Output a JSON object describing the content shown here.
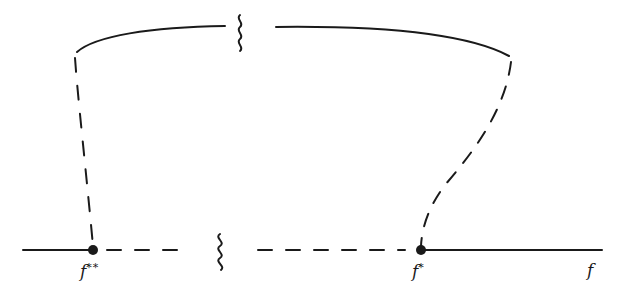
{
  "diagram": {
    "labels": {
      "f_double_star": {
        "base": "f",
        "sup": "**"
      },
      "f_star": {
        "base": "f",
        "sup": "*"
      },
      "f": {
        "base": "f"
      }
    },
    "points": [
      {
        "name": "f**",
        "x": 93,
        "y": 250
      },
      {
        "name": "f*",
        "x": 421,
        "y": 250
      }
    ],
    "colors": {
      "ink": "#1a1a1a",
      "background": "#ffffff"
    }
  }
}
